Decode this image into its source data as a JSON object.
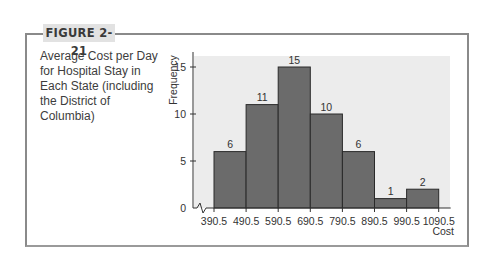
{
  "figure": {
    "label": "FIGURE 2-21",
    "caption": "Average Cost per Day for Hospital Stay in Each State (including the District of Columbia)"
  },
  "chart_data": {
    "type": "bar",
    "subtype": "histogram",
    "title": "Average Cost per Day for Hospital Stay in Each State (including the District of Columbia)",
    "xlabel": "Cost",
    "ylabel": "Frequency",
    "bin_edges": [
      390.5,
      490.5,
      590.5,
      690.5,
      790.5,
      890.5,
      990.5,
      1090.5
    ],
    "categories": [
      "390.5-490.5",
      "490.5-590.5",
      "590.5-690.5",
      "690.5-790.5",
      "790.5-890.5",
      "890.5-990.5",
      "990.5-1090.5"
    ],
    "values": [
      6,
      11,
      15,
      10,
      6,
      1,
      2
    ],
    "data_labels": [
      "6",
      "11",
      "15",
      "10",
      "6",
      "1",
      "2"
    ],
    "x_tick_labels": [
      "390.5",
      "490.5",
      "590.5",
      "690.5",
      "790.5",
      "890.5",
      "990.5",
      "1090.5"
    ],
    "y_ticks": [
      0,
      5,
      10,
      15
    ],
    "ylim": [
      0,
      16
    ],
    "axis_break_on_x": true,
    "grid": false,
    "legend": null,
    "bar_color": "#6b6b6b",
    "plot_bg_color": "#ececec"
  }
}
